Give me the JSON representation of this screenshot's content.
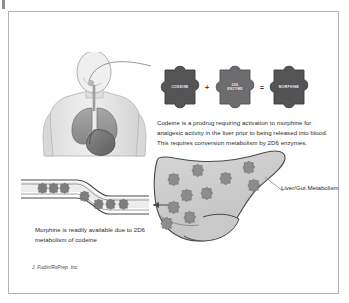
{
  "figure": {
    "attribution": "J. Fudin/RxPrep, Inc."
  },
  "equation": {
    "pieces": [
      {
        "id": "codeine",
        "label": "CODEINE",
        "lines": [
          "CODEINE"
        ],
        "color": "#545456"
      },
      {
        "id": "enzyme-2d6",
        "label": "2D6 ENZYME",
        "lines": [
          "2D6",
          "ENZYME"
        ],
        "color": "#6d6d6f"
      },
      {
        "id": "morphine",
        "label": "MORPHINE",
        "lines": [
          "MORPHINE"
        ],
        "color": "#545456"
      }
    ],
    "operators": {
      "plus": "+",
      "equals": "="
    }
  },
  "captions": {
    "prodrug": "Codeine is a prodrug requiring activation to morphine for analgesic activity in the liver prior to being released into blood. This requires conversion metabolism by 2D6 enzymes.",
    "morphine_available": "Morphine is readily available due to 2D6 metabolism of codeine",
    "liver_gut": "Liver/Gut Metabolism"
  },
  "anatomy": {
    "torso_label": "human-torso-with-lungs-and-stomach",
    "liver_label": "liver-organ",
    "vessel_label": "blood-vessel",
    "liver_puzzle_count": 10,
    "vessel_puzzle_count": 7
  },
  "colors": {
    "frame_border": "#b4b4b4",
    "background": "#ffffff",
    "piece_dark": "#545456",
    "piece_mid": "#6d6d6f",
    "liver_fill": "#cfcfcf",
    "liver_stroke": "#4a4a4a",
    "mini_piece": "#8a8a8c",
    "vessel_fill": "#e8e8e8",
    "vessel_stroke": "#4a4a4a",
    "text": "#2a2a2a",
    "body_light": "#e6e6e6",
    "lung": "#9a9a9a",
    "stomach": "#6f6f6f"
  }
}
